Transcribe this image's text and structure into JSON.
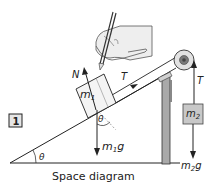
{
  "diagram": {
    "figure_number": "1",
    "caption": "Space diagram",
    "labels": {
      "normal_force": "N",
      "tension_block1": "T",
      "mass1": "m",
      "mass1_sub": "1",
      "angle_at_block": "θ",
      "weight1": "m",
      "weight1_sub": "1",
      "weight1_g": "g",
      "angle_at_base": "θ",
      "tension_block2": "T",
      "mass2": "m",
      "mass2_sub": "2",
      "weight2": "m",
      "weight2_sub": "2",
      "weight2_g": "g"
    },
    "colors": {
      "line": "#222222",
      "block_fill": "#f4f4f4",
      "mass2_fill": "#c8c8c8",
      "support_fill": "#a9a9a9",
      "pulley_outer": "#e2e2e2",
      "pulley_inner": "#7a7a7a",
      "hand_fill": "#eeeeee"
    }
  }
}
